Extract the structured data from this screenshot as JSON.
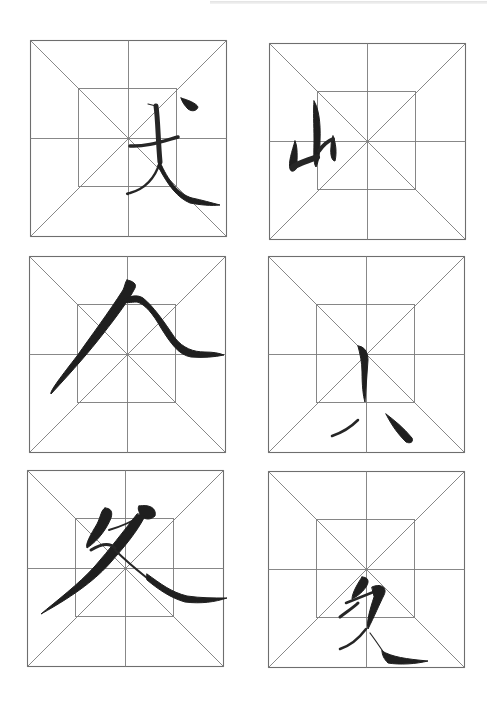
{
  "page": {
    "type": "calligraphy practice sheet",
    "grid_style": "mi-zi-ge (米字格) with inner square",
    "line_color": "#7a7a7a",
    "ink_color": "#1f1f1f",
    "background": "#ffffff"
  },
  "cells": [
    {
      "id": 1,
      "row": 1,
      "col": 1,
      "character": "丈",
      "description": "brush stroke character in lower-right quadrant"
    },
    {
      "id": 2,
      "row": 1,
      "col": 2,
      "character": "山",
      "description": "brush stroke character in left-middle area"
    },
    {
      "id": 3,
      "row": 2,
      "col": 1,
      "character": "人",
      "description": "large sweeping stroke character"
    },
    {
      "id": 4,
      "row": 2,
      "col": 2,
      "character": "小",
      "description": "brush stroke character below center"
    },
    {
      "id": 5,
      "row": 3,
      "col": 1,
      "character": "友",
      "description": "large brush stroke character with long sweep"
    },
    {
      "id": 6,
      "row": 3,
      "col": 2,
      "character": "友",
      "description": "small brush stroke character in lower half"
    }
  ]
}
